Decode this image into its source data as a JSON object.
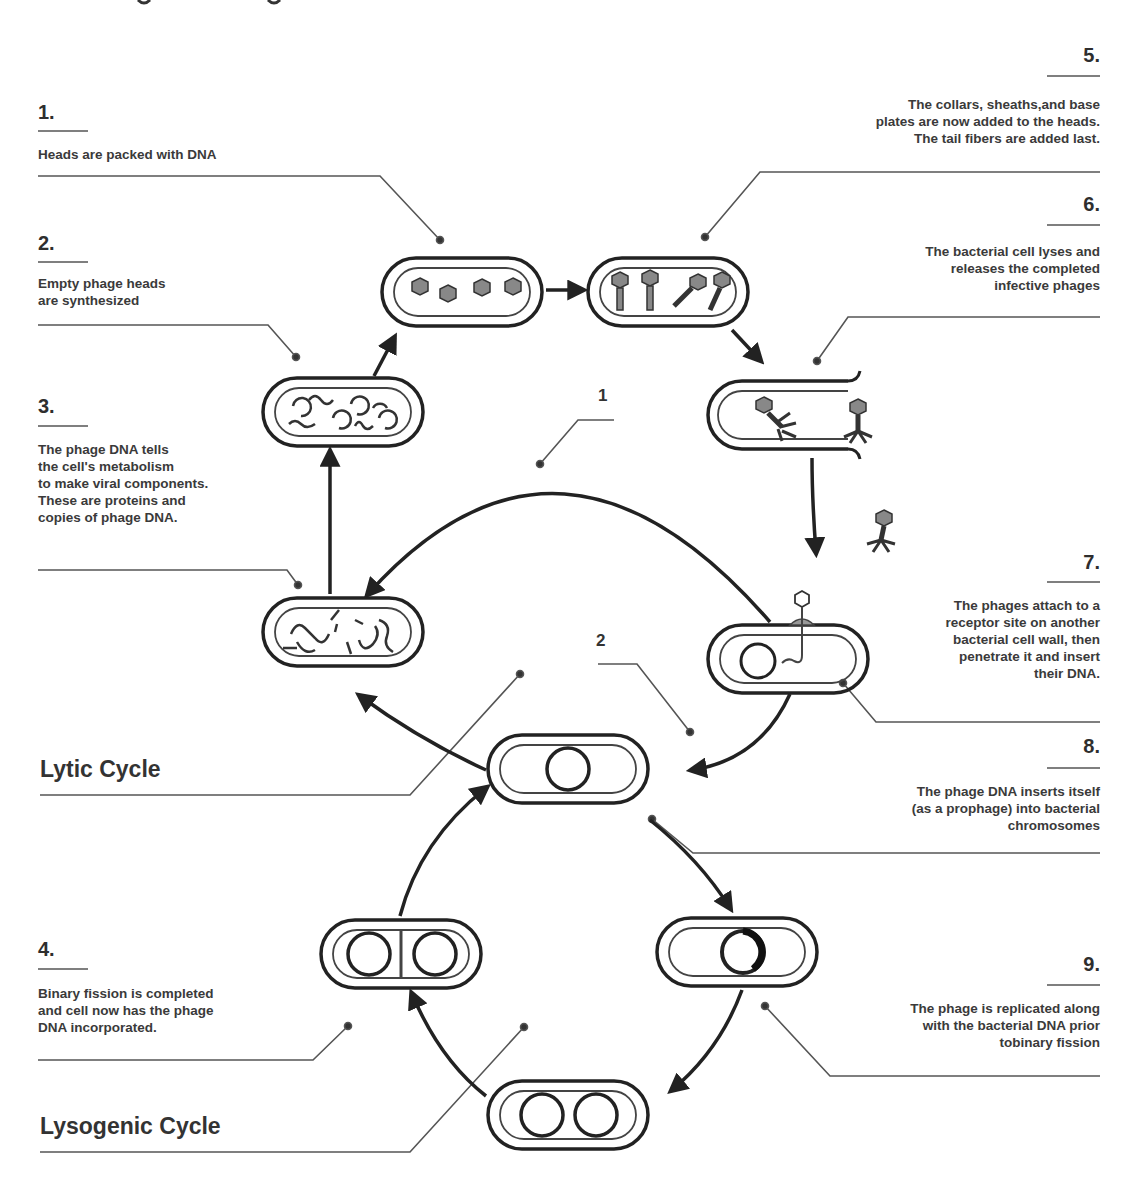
{
  "diagram": {
    "type": "biological cycle diagram",
    "cycles": [
      {
        "label": "Lytic Cycle",
        "marker": "1"
      },
      {
        "label": "Lysogenic Cycle",
        "marker": "2"
      }
    ],
    "markers": {
      "m1": "1",
      "m2": "2"
    },
    "steps": [
      {
        "number": "1.",
        "text": [
          "Heads are packed with DNA"
        ]
      },
      {
        "number": "2.",
        "text": [
          "Empty phage heads",
          "are synthesized"
        ]
      },
      {
        "number": "3.",
        "text": [
          "The phage DNA tells",
          "the cell's metabolism",
          "to make viral components.",
          "These are proteins and",
          "copies of phage DNA."
        ]
      },
      {
        "number": "4.",
        "text": [
          "Binary fission is completed",
          "and cell now has the phage",
          "DNA incorporated."
        ]
      },
      {
        "number": "5.",
        "text": [
          "The collars, sheaths,and base",
          "plates are now added to the heads.",
          "The tail fibers are added last."
        ]
      },
      {
        "number": "6.",
        "text": [
          "The bacterial cell lyses and",
          "releases the completed",
          "infective phages"
        ]
      },
      {
        "number": "7.",
        "text": [
          "The phages attach to a",
          "receptor site on another",
          "bacterial cell wall, then",
          "penetrate it and insert",
          "their DNA."
        ]
      },
      {
        "number": "8.",
        "text": [
          "The phage DNA inserts itself",
          "(as a prophage) into bacterial",
          "chromosomes"
        ]
      },
      {
        "number": "9.",
        "text": [
          "The phage is replicated along",
          "with the bacterial DNA prior",
          "tobinary fission"
        ]
      }
    ],
    "colors": {
      "ink": "#2b2b2b",
      "leader": "#555555",
      "background": "#ffffff"
    }
  }
}
